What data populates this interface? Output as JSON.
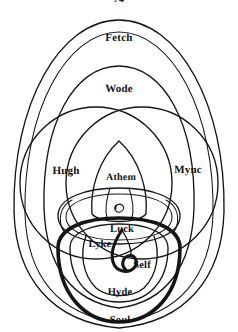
{
  "page": {
    "folio": "24",
    "width": 238,
    "height": 332,
    "background_color": "#ffffff",
    "ink_color": "#151515"
  },
  "diagram": {
    "kind": "nested-soul-parts-diagram",
    "labels": [
      {
        "id": "fetch",
        "text": "Fetch",
        "region": "outermost-ring",
        "x": 119,
        "y": 38
      },
      {
        "id": "wode",
        "text": "Wode",
        "region": "second-ring",
        "x": 119,
        "y": 89
      },
      {
        "id": "hugh",
        "text": "Hugh",
        "region": "left-lens",
        "x": 66,
        "y": 171
      },
      {
        "id": "mync",
        "text": "Mync",
        "region": "right-lens",
        "x": 188,
        "y": 170
      },
      {
        "id": "athem",
        "text": "Athem",
        "region": "central-vesica",
        "x": 121,
        "y": 177
      },
      {
        "id": "luck",
        "text": "Luck",
        "region": "inner-knot",
        "x": 122,
        "y": 229
      },
      {
        "id": "lyke",
        "text": "Lyke",
        "region": "lower-left-inner",
        "x": 100,
        "y": 244
      },
      {
        "id": "self",
        "text": "Self",
        "region": "spiral-core",
        "x": 142,
        "y": 265
      },
      {
        "id": "hyde",
        "text": "Hyde",
        "region": "lower-inner-ring",
        "x": 120,
        "y": 292
      },
      {
        "id": "soul",
        "text": "Soul",
        "region": "bold-outer-lower-ring",
        "x": 120,
        "y": 320
      }
    ]
  }
}
